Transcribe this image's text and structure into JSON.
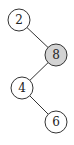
{
  "diagram": {
    "type": "binary-tree",
    "nodes": [
      {
        "id": "n2",
        "label": "2",
        "cx": 19,
        "cy": 20,
        "r": 11,
        "fill": "#ffffff",
        "highlighted": false
      },
      {
        "id": "n8",
        "label": "8",
        "cx": 56,
        "cy": 55,
        "r": 11,
        "fill": "#d3d3d3",
        "highlighted": true
      },
      {
        "id": "n4",
        "label": "4",
        "cx": 22,
        "cy": 88,
        "r": 11,
        "fill": "#ffffff",
        "highlighted": false
      },
      {
        "id": "n6",
        "label": "6",
        "cx": 56,
        "cy": 122,
        "r": 11,
        "fill": "#ffffff",
        "highlighted": false
      }
    ],
    "edges": [
      {
        "from": "n2",
        "to": "n8"
      },
      {
        "from": "n8",
        "to": "n4"
      },
      {
        "from": "n4",
        "to": "n6"
      }
    ],
    "colors": {
      "stroke": "#333333",
      "highlight": "#d3d3d3",
      "background": "#ffffff"
    }
  }
}
